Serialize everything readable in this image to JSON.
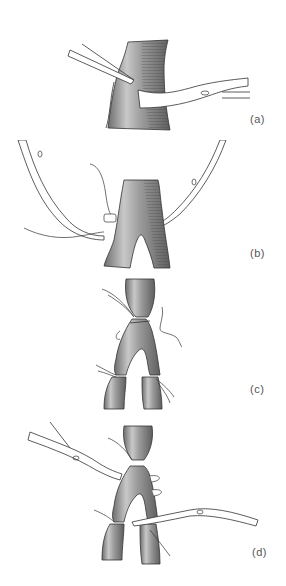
{
  "figure": {
    "panels": [
      {
        "id": "a",
        "label": "(a)",
        "description": "Vessel dissected with forceps; curved clamp passed behind vessel"
      },
      {
        "id": "b",
        "label": "(b)",
        "description": "Ligature passed around branch; two clamps holding suture ends"
      },
      {
        "id": "c",
        "label": "(c)",
        "description": "Bifurcating vessel ligated with sutures at trunk and both branches"
      },
      {
        "id": "d",
        "label": "(d)",
        "description": "Multiple ligatures placed; clamps applied on either side"
      }
    ]
  },
  "colors": {
    "vessel_fill": "#9a9a9a",
    "vessel_dark": "#5a5a5a",
    "vessel_light": "#d8d8d8",
    "outline": "#333333",
    "instrument": "#ffffff",
    "label_text": "#555555"
  }
}
